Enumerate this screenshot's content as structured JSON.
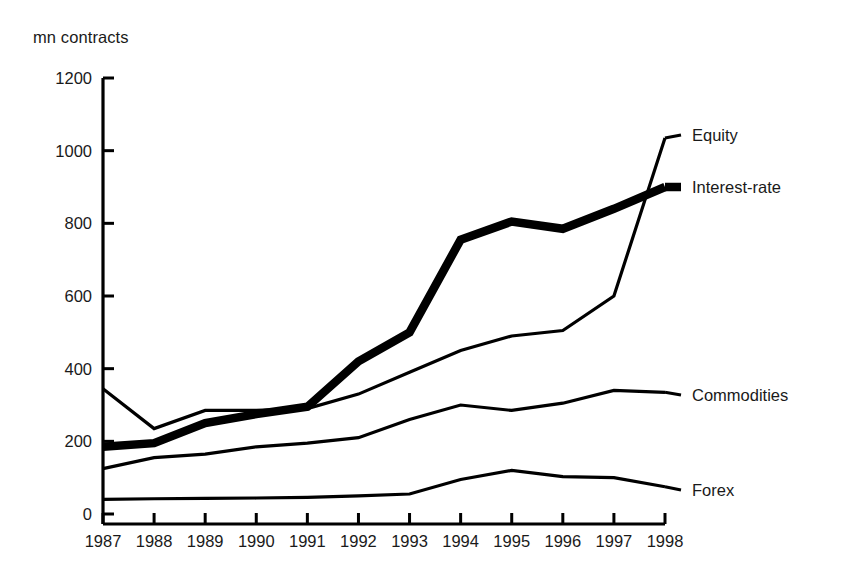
{
  "chart_data": {
    "type": "line",
    "title": "",
    "subtitle": "",
    "xlabel": "",
    "ylabel": "mn contracts",
    "unit_label": "mn contracts",
    "categories": [
      "1987",
      "1988",
      "1989",
      "1990",
      "1991",
      "1992",
      "1993",
      "1994",
      "1995",
      "1996",
      "1997",
      "1998"
    ],
    "x": [
      1987,
      1988,
      1989,
      1990,
      1991,
      1992,
      1993,
      1994,
      1995,
      1996,
      1997,
      1998
    ],
    "xlim": [
      1987,
      1998
    ],
    "ylim": [
      0,
      1200
    ],
    "yticks": [
      0,
      200,
      400,
      600,
      800,
      1000,
      1200
    ],
    "ytick_labels": [
      "0",
      "200",
      "400",
      "600",
      "800",
      "1000",
      "1200"
    ],
    "grid": false,
    "legend_position": "right-inline-labels",
    "series": [
      {
        "name": "Equity",
        "label": "Equity",
        "style": "thin",
        "color": "#000000",
        "values": [
          345,
          235,
          285,
          285,
          290,
          330,
          390,
          450,
          490,
          505,
          600,
          1035
        ]
      },
      {
        "name": "Interest-rate",
        "label": "Interest-rate",
        "style": "thick",
        "color": "#000000",
        "values": [
          185,
          195,
          250,
          275,
          295,
          420,
          500,
          755,
          805,
          785,
          840,
          900
        ]
      },
      {
        "name": "Commodities",
        "label": "Commodities",
        "style": "thin",
        "color": "#000000",
        "values": [
          125,
          155,
          165,
          185,
          195,
          210,
          260,
          300,
          285,
          305,
          340,
          335
        ]
      },
      {
        "name": "Forex",
        "label": "Forex",
        "style": "thin",
        "color": "#000000",
        "values": [
          40,
          42,
          43,
          44,
          46,
          50,
          55,
          95,
          120,
          103,
          100,
          75
        ]
      }
    ],
    "annotations": []
  },
  "geometry": {
    "plot_left": 103,
    "plot_right": 665,
    "plot_top": 78,
    "plot_bottom": 514,
    "axis_baseline_y": 524
  },
  "series_label_positions": [
    {
      "name": "Equity",
      "y": 135
    },
    {
      "name": "Interest-rate",
      "y": 187
    },
    {
      "name": "Commodities",
      "y": 395
    },
    {
      "name": "Forex",
      "y": 490
    }
  ],
  "colors": {
    "ink": "#000000",
    "text": "#1a1a1a",
    "background": "#ffffff"
  }
}
